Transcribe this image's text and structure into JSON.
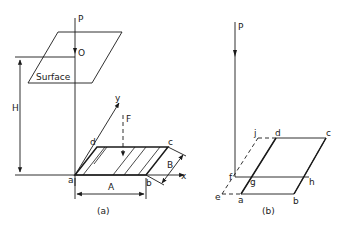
{
  "figure": {
    "panel_a": {
      "caption": "(a)",
      "labels": {
        "P": "P",
        "O": "O",
        "surface": "Surface",
        "H": "H",
        "y": "y",
        "F": "F",
        "x": "x",
        "a": "a",
        "b": "b",
        "c": "c",
        "d": "d",
        "A": "A",
        "B": "B"
      }
    },
    "panel_b": {
      "caption": "(b)",
      "labels": {
        "P": "P",
        "a": "a",
        "b": "b",
        "c": "c",
        "d": "d",
        "e": "e",
        "f": "f",
        "g": "g",
        "h": "h",
        "j": "j"
      }
    },
    "colors": {
      "ink": "#1a1a1a",
      "background": "#ffffff"
    }
  }
}
